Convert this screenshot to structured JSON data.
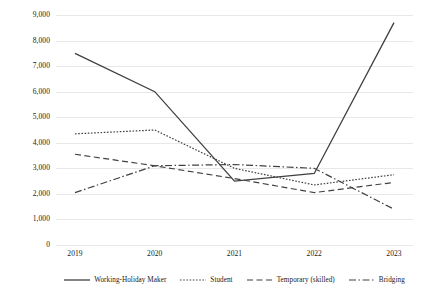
{
  "chart_data": {
    "type": "line",
    "title": "",
    "subtitle": "",
    "xlabel": "",
    "ylabel": "",
    "categories": [
      "2019",
      "2020",
      "2021",
      "2022",
      "2023"
    ],
    "x": [
      2019,
      2020,
      2021,
      2022,
      2023
    ],
    "ylim": [
      0,
      9000
    ],
    "ytick_values": [
      0,
      1000,
      2000,
      3000,
      4000,
      5000,
      6000,
      7000,
      8000,
      9000
    ],
    "ytick_labels": [
      "0",
      "1,000",
      "2,000",
      "3,000",
      "4,000",
      "5,000",
      "6,000",
      "7,000",
      "8,000",
      "9,000"
    ],
    "grid": true,
    "grid_axis": "y",
    "legend_position": "bottom",
    "series": [
      {
        "name": "Working-Holiday Maker",
        "values": [
          7500,
          6000,
          2500,
          2800,
          8700
        ],
        "style": "solid",
        "color": "#404040",
        "dasharray": "",
        "width": 1.3
      },
      {
        "name": "Student",
        "values": [
          4350,
          4500,
          3000,
          2350,
          2750
        ],
        "style": "dotted",
        "color": "#404040",
        "dasharray": "1.6,1.6",
        "width": 1.2
      },
      {
        "name": "Temporary (skilled)",
        "values": [
          3550,
          3100,
          2600,
          2050,
          2450
        ],
        "style": "dashed",
        "color": "#404040",
        "dasharray": "6,3.5",
        "width": 1.2
      },
      {
        "name": "Bridging",
        "values": [
          2050,
          3100,
          3150,
          3000,
          1400
        ],
        "style": "dash-dot",
        "color": "#404040",
        "dasharray": "7,2.5,1.5,2.5",
        "width": 1.2
      }
    ]
  },
  "legend": {
    "items": [
      {
        "label": "Working-Holiday Maker"
      },
      {
        "label": "Student"
      },
      {
        "label": "Temporary (skilled)"
      },
      {
        "label": "Bridging"
      }
    ]
  },
  "colors": {
    "line": "#404040",
    "gridline": "#e8e8e8",
    "text": "#202020",
    "background": "#ffffff"
  }
}
